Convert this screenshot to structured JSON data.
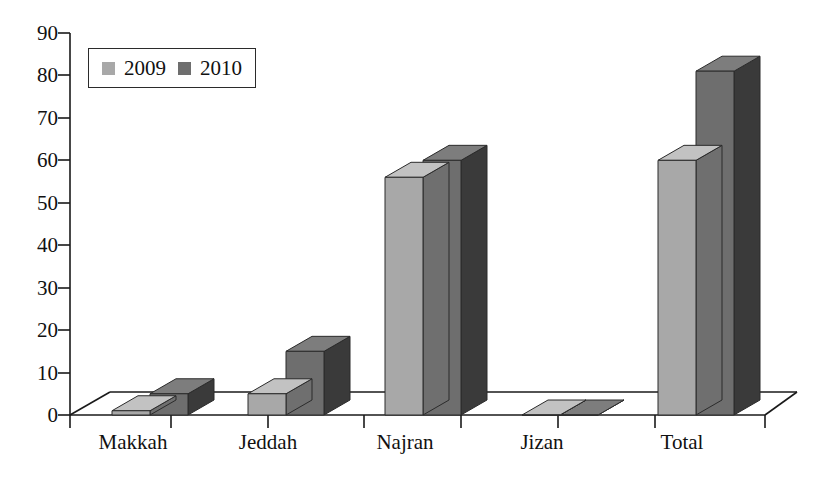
{
  "chart_data": {
    "type": "bar",
    "title": "",
    "subtitle": "",
    "xlabel": "",
    "ylabel": "",
    "categories": [
      "Makkah",
      "Jeddah",
      "Najran",
      "Jizan",
      "Total"
    ],
    "series": [
      {
        "name": "2009",
        "values": [
          1,
          5,
          56,
          0,
          60
        ],
        "color": "#a8a8a8"
      },
      {
        "name": "2010",
        "values": [
          5,
          15,
          60,
          0,
          81
        ],
        "color": "#6e6e6e"
      }
    ],
    "ylim": [
      0,
      90
    ],
    "yticks": [
      0,
      10,
      20,
      30,
      40,
      50,
      60,
      70,
      80,
      90
    ],
    "ytick_labels": [
      "0",
      "10",
      "20",
      "30",
      "40",
      "50",
      "60",
      "70",
      "80",
      "90"
    ],
    "grid": false,
    "style": "3d-column",
    "legend_position": "top-left",
    "legend_entries": [
      "2009",
      "2010"
    ]
  },
  "colors": {
    "series_2009_front": "#a8a8a8",
    "series_2009_top": "#c2c2c2",
    "series_2009_side": "#6f6f6f",
    "series_2010_front": "#6e6e6e",
    "series_2010_top": "#7d7d7d",
    "series_2010_side": "#3a3a3a",
    "axis": "#1a1a1a",
    "text": "#111111",
    "background": "#ffffff"
  }
}
